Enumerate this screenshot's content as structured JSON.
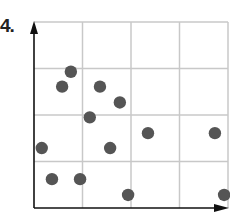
{
  "problem_label": "4.",
  "chart_data": {
    "type": "scatter",
    "title": "",
    "xlabel": "",
    "ylabel": "",
    "grid": true,
    "grid_cells": {
      "columns": 4,
      "rows": 4
    },
    "xlim": [
      0,
      4
    ],
    "ylim": [
      0,
      4
    ],
    "axes": {
      "x_arrow": true,
      "y_arrow": true
    },
    "points": [
      {
        "x": 0.76,
        "y": 2.93
      },
      {
        "x": 0.58,
        "y": 2.61
      },
      {
        "x": 1.36,
        "y": 2.61
      },
      {
        "x": 1.77,
        "y": 2.27
      },
      {
        "x": 1.15,
        "y": 1.95
      },
      {
        "x": 2.35,
        "y": 1.61
      },
      {
        "x": 3.73,
        "y": 1.61
      },
      {
        "x": 0.16,
        "y": 1.29
      },
      {
        "x": 1.57,
        "y": 1.29
      },
      {
        "x": 0.37,
        "y": 0.62
      },
      {
        "x": 0.95,
        "y": 0.62
      },
      {
        "x": 1.94,
        "y": 0.28
      },
      {
        "x": 3.92,
        "y": 0.28
      }
    ],
    "colors": {
      "point": "#555555",
      "grid": "#c8c8c8",
      "axis": "#111111"
    }
  }
}
